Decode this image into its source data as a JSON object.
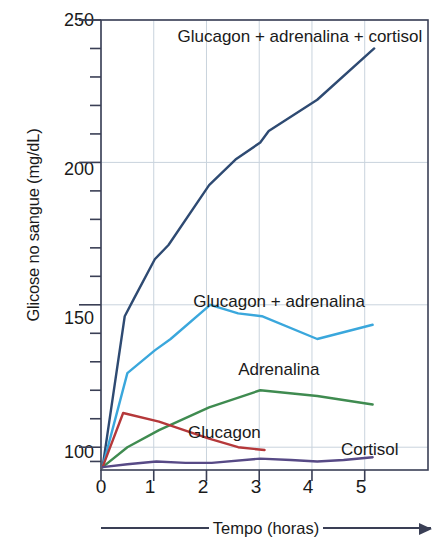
{
  "chart_data": {
    "type": "line",
    "title": "",
    "xlabel": "Tempo (horas)",
    "ylabel": "Glicose no sangue (mg/dL)",
    "xlim": [
      0,
      6.2
    ],
    "ylim": [
      92,
      250
    ],
    "xticks": [
      0,
      1,
      2,
      3,
      4,
      5
    ],
    "xtick_labels": [
      "0",
      "1",
      "2",
      "3",
      "4",
      "5"
    ],
    "yticks": [
      100,
      150,
      200,
      250
    ],
    "ytick_labels": [
      "100",
      "150",
      "200",
      "250"
    ],
    "y_minor_step": 10,
    "grid": true,
    "legend_position": "inline-annotations",
    "series": [
      {
        "name": "Glucagon + adrenalina + cortisol",
        "color": "#2e4a72",
        "label_x": 1.45,
        "label_y": 244,
        "x": [
          0.03,
          0.45,
          0.62,
          1.02,
          1.28,
          2.05,
          2.55,
          3.02,
          3.18,
          4.1,
          5.18
        ],
        "y": [
          93,
          146,
          152,
          166,
          171,
          192,
          201,
          207,
          211,
          222,
          240
        ]
      },
      {
        "name": "Glucagon + adrenalina",
        "color": "#3aa7dc",
        "label_x": 1.75,
        "label_y": 151,
        "x": [
          0.03,
          0.5,
          1.02,
          1.32,
          2.07,
          2.6,
          3.05,
          4.1,
          5.15
        ],
        "y": [
          93,
          126,
          134,
          138,
          150,
          147,
          146,
          138,
          143
        ]
      },
      {
        "name": "Adrenalina",
        "color": "#3f8b50",
        "label_x": 2.6,
        "label_y": 127,
        "x": [
          0.03,
          0.5,
          1.1,
          2.05,
          3.02,
          4.1,
          5.15
        ],
        "y": [
          93,
          100,
          106,
          114,
          120,
          118,
          115
        ]
      },
      {
        "name": "Glucagon",
        "color": "#b5383a",
        "label_x": 1.65,
        "label_y": 105,
        "x": [
          0.03,
          0.42,
          1.1,
          2.05,
          2.6,
          3.1
        ],
        "y": [
          93,
          112,
          109,
          103,
          100,
          99
        ]
      },
      {
        "name": "Cortisol",
        "color": "#574a86",
        "label_x": 4.55,
        "label_y": 99,
        "x": [
          0.03,
          0.5,
          1.05,
          1.6,
          2.1,
          3.02,
          3.6,
          4.1,
          4.6,
          5.15
        ],
        "y": [
          93,
          94,
          95,
          94.5,
          94.5,
          96,
          95.5,
          95,
          95.5,
          96.5
        ]
      }
    ]
  },
  "axes": {
    "ytick_labels": [
      "250",
      "200",
      "150",
      "100"
    ],
    "xtick_labels": [
      "0",
      "1",
      "2",
      "3",
      "4",
      "5"
    ],
    "x_title": "Tempo (horas)",
    "y_title": "Glicose no sangue (mg/dL)"
  },
  "annotations": {
    "combo_all": "Glucagon + adrenalina + cortisol",
    "combo_two": "Glucagon + adrenalina",
    "adrenalina": "Adrenalina",
    "glucagon": "Glucagon",
    "cortisol": "Cortisol"
  },
  "colors": {
    "navy": "#2e4a72",
    "light_blue": "#3aa7dc",
    "green": "#3f8b50",
    "red": "#b5383a",
    "purple": "#574a86",
    "axis": "#3a3f55",
    "grid": "#c9d3dd"
  }
}
